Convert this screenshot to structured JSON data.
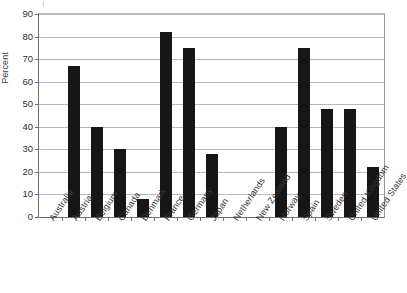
{
  "chart_data": {
    "type": "bar",
    "title": "",
    "subtitle": "",
    "xlabel": "",
    "ylabel": "Percent",
    "ylim": [
      0,
      90
    ],
    "yticks": [
      0,
      10,
      20,
      30,
      40,
      50,
      60,
      70,
      80,
      90
    ],
    "ytick_labels": [
      "0",
      "10",
      "20",
      "30",
      "40",
      "50",
      "60",
      "70",
      "80",
      "90"
    ],
    "grid": true,
    "legend": false,
    "legend_position": "none",
    "bar_color": "#161616",
    "gridline_color": "#b9b9b9",
    "axis_color": "#6f6f6f",
    "categories": [
      "Australia",
      "Austria",
      "Belgium",
      "Canada",
      "Denmark",
      "France",
      "Germany",
      "Japan",
      "Netherlands",
      "New Zealand",
      "Norway",
      "Spain",
      "Sweden",
      "United Kingdom",
      "United States"
    ],
    "values": [
      0,
      67,
      40,
      30,
      8,
      82,
      75,
      28,
      0,
      0,
      40,
      75,
      48,
      48,
      22
    ]
  }
}
